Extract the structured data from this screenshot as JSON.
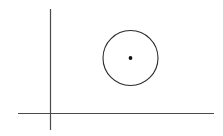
{
  "canvas": {
    "width": 223,
    "height": 136,
    "background_color": "#ffffff",
    "title": "Geometric diagram: coordinate axes with circle and center point"
  },
  "style": {
    "axis_stroke_color": "#4a4a4a",
    "axis_stroke_width": 1.2,
    "circle_stroke_color": "#2b2b2b",
    "circle_stroke_width": 1.1,
    "point_fill_color": "#111111"
  },
  "chart_data": {
    "type": "scatter",
    "title": "",
    "xlabel": "",
    "ylabel": "",
    "grid": false,
    "legend": null,
    "axes": {
      "vertical_axis": {
        "name": "y-axis",
        "x": 50.5,
        "y_top": 9,
        "y_bottom": 130
      },
      "horizontal_axis": {
        "name": "x-axis",
        "y": 113.5,
        "x_left": 18,
        "x_right": 214
      },
      "origin": {
        "x": 50.5,
        "y": 113.5
      }
    },
    "shapes": [
      {
        "name": "circle",
        "type": "circle",
        "cx": 130.5,
        "cy": 58,
        "r": 27.5
      },
      {
        "name": "center-point",
        "type": "point",
        "cx": 130.5,
        "cy": 58,
        "r": 1.9
      }
    ]
  }
}
